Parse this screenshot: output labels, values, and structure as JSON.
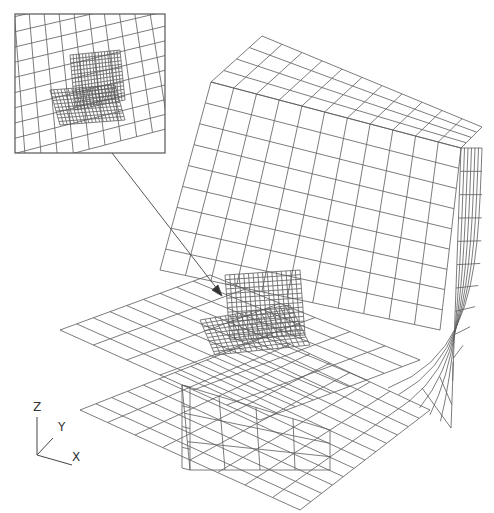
{
  "figure": {
    "type": "finite-element-mesh",
    "line_color": "#555555",
    "background": "#ffffff"
  },
  "inset": {
    "label": "zoomed detail of refined mesh region",
    "box": {
      "x": 15,
      "y": 14,
      "w": 150,
      "h": 139
    }
  },
  "pointer": {
    "from": [
      112,
      153
    ],
    "to": [
      222,
      295
    ]
  },
  "axes_triad": {
    "z_label": "Z",
    "y_label": "Y",
    "x_label": "X"
  }
}
